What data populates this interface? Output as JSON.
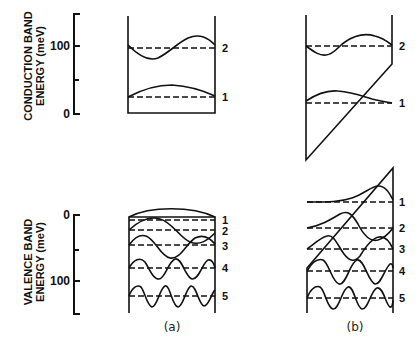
{
  "conduction": {
    "axis_label_line1": "CONDUCTION BAND",
    "axis_label_line2": "ENERGY (meV)",
    "ticks": [
      {
        "label": "100"
      },
      {
        "label": "0"
      }
    ],
    "levels_a": [
      "2",
      "1"
    ],
    "levels_b": [
      "2",
      "1"
    ]
  },
  "valence": {
    "axis_label_line1": "VALENCE BAND",
    "axis_label_line2": "ENERGY (meV)",
    "ticks": [
      {
        "label": "0"
      },
      {
        "label": "100"
      }
    ],
    "levels_a": [
      "1",
      "2",
      "3",
      "4",
      "5"
    ],
    "levels_b": [
      "1",
      "2",
      "3",
      "4",
      "5"
    ]
  },
  "panels": {
    "a": "(a)",
    "b": "(b)"
  }
}
